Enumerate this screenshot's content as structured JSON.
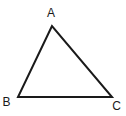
{
  "diagram": {
    "type": "triangle",
    "vertices": [
      {
        "label": "A",
        "x": 52,
        "y": 26,
        "label_x": 51,
        "label_y": 17
      },
      {
        "label": "B",
        "x": 18,
        "y": 97,
        "label_x": 6.5,
        "label_y": 106
      },
      {
        "label": "C",
        "x": 112,
        "y": 97,
        "label_x": 116.5,
        "label_y": 110
      }
    ],
    "stroke_color": "#1a1a1a",
    "background": "#ffffff"
  }
}
